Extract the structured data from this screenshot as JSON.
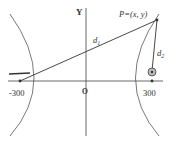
{
  "diagram": {
    "axis_y_label": "Y",
    "origin_label": "O",
    "point_label": "P=(x, y)",
    "d1_label": "d",
    "d1_sub": "1",
    "d2_label": "d",
    "d2_sub": "2",
    "left_focus_label": "-300",
    "right_focus_label": "300",
    "colors": {
      "line": "#333333",
      "curve": "#555555",
      "marker_fill": "#999999"
    }
  }
}
